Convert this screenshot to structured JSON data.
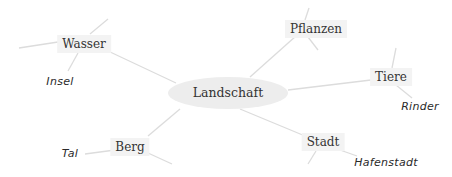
{
  "mindmap": {
    "center": {
      "label": "Landschaft",
      "x": 228,
      "y": 93
    },
    "branches": [
      {
        "id": "wasser",
        "label": "Wasser",
        "x": 84,
        "y": 44,
        "children": [
          {
            "label": "Insel",
            "x": 60,
            "y": 81
          }
        ]
      },
      {
        "id": "pflanzen",
        "label": "Pflanzen",
        "x": 316,
        "y": 29,
        "children": []
      },
      {
        "id": "tiere",
        "label": "Tiere",
        "x": 391,
        "y": 77,
        "children": [
          {
            "label": "Rinder",
            "x": 420,
            "y": 106
          }
        ]
      },
      {
        "id": "stadt",
        "label": "Stadt",
        "x": 323,
        "y": 142,
        "children": [
          {
            "label": "Hafenstadt",
            "x": 386,
            "y": 162
          }
        ]
      },
      {
        "id": "berg",
        "label": "Berg",
        "x": 130,
        "y": 147,
        "children": [
          {
            "label": "Tal",
            "x": 70,
            "y": 153
          }
        ]
      }
    ]
  },
  "colors": {
    "center_fill": "#ededed",
    "node_fill": "#f3f3f3",
    "line": "#dcdcdc",
    "text": "#333333"
  }
}
